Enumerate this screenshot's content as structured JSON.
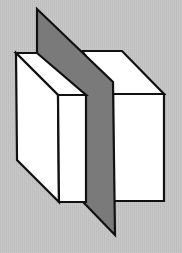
{
  "diagram": {
    "colors": {
      "background": "#c6c6c6",
      "box_face": "#ffffff",
      "plane": "#7a7a7a",
      "outline": "#111111"
    },
    "shapes": {
      "right_box": {
        "top_face": "82,51 122,51 164,94 113,94",
        "front_face": "113,94 164,94 164,201 113,201"
      },
      "plane": {
        "polygon": "37,9 113,82 115,235 86,205 37,155"
      },
      "left_box": {
        "top_face": "16,53 37,53 86,95 58,95",
        "side_face": "16,53 58,95 59,202 17,160",
        "front_face": "58,95 86,95 86,202 59,202"
      }
    }
  }
}
